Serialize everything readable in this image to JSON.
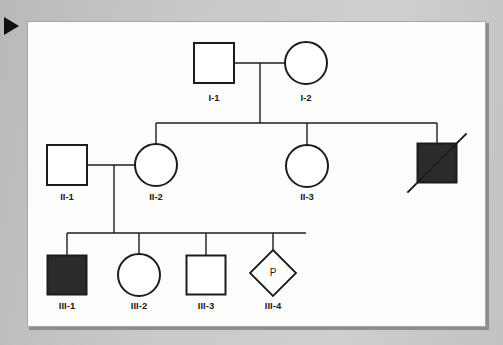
{
  "figure": {
    "marker_icon": "play-triangle-icon",
    "background_color": "#c8c8c8",
    "panel_color": "#fdfdfb",
    "line_color": "#1c1c1c",
    "affected_fill_color": "#2b2b2b",
    "unaffected_fill_color": "#ffffff"
  },
  "chart_data": {
    "type": "diagram",
    "diagram_type": "pedigree",
    "generations": [
      "I",
      "II",
      "III"
    ],
    "individuals": [
      {
        "id": "I-1",
        "label": "I-1",
        "shape": "square",
        "sex": "male",
        "affected": false,
        "deceased": false,
        "proband": false,
        "x": 213,
        "y": 62,
        "size": 40,
        "label_x": 213,
        "label_y": 97
      },
      {
        "id": "I-2",
        "label": "I-2",
        "shape": "circle",
        "sex": "female",
        "affected": false,
        "deceased": false,
        "proband": false,
        "x": 305,
        "y": 62,
        "size": 42,
        "label_x": 305,
        "label_y": 97
      },
      {
        "id": "II-1",
        "label": "II-1",
        "shape": "square",
        "sex": "male",
        "affected": false,
        "deceased": false,
        "proband": false,
        "x": 66,
        "y": 164,
        "size": 40,
        "label_x": 66,
        "label_y": 196
      },
      {
        "id": "II-2",
        "label": "II-2",
        "shape": "circle",
        "sex": "female",
        "affected": false,
        "deceased": false,
        "proband": false,
        "x": 155,
        "y": 164,
        "size": 42,
        "label_x": 155,
        "label_y": 196
      },
      {
        "id": "II-3",
        "label": "II-3",
        "shape": "circle",
        "sex": "female",
        "affected": false,
        "deceased": false,
        "proband": false,
        "x": 306,
        "y": 165,
        "size": 42,
        "label_x": 306,
        "label_y": 196
      },
      {
        "id": "II-4",
        "label": "",
        "shape": "square",
        "sex": "male",
        "affected": true,
        "deceased": true,
        "proband": false,
        "x": 436,
        "y": 162,
        "size": 39,
        "label_x": 436,
        "label_y": 196
      },
      {
        "id": "III-1",
        "label": "III-1",
        "shape": "square",
        "sex": "male",
        "affected": true,
        "deceased": false,
        "proband": false,
        "x": 66,
        "y": 274,
        "size": 39,
        "label_x": 66,
        "label_y": 305
      },
      {
        "id": "III-2",
        "label": "III-2",
        "shape": "circle",
        "sex": "female",
        "affected": false,
        "deceased": false,
        "proband": false,
        "x": 138,
        "y": 274,
        "size": 42,
        "label_x": 138,
        "label_y": 305
      },
      {
        "id": "III-3",
        "label": "III-3",
        "shape": "square",
        "sex": "male",
        "affected": false,
        "deceased": false,
        "proband": false,
        "x": 205,
        "y": 274,
        "size": 39,
        "label_x": 205,
        "label_y": 305
      },
      {
        "id": "III-4",
        "label": "III-4",
        "shape": "diamond",
        "sex": "unknown",
        "affected": false,
        "deceased": false,
        "proband": true,
        "proband_marker": "P",
        "x": 272,
        "y": 272,
        "size": 46,
        "label_x": 272,
        "label_y": 305
      }
    ],
    "matings": [
      {
        "id": "mating-I",
        "partners": [
          "I-1",
          "I-2"
        ],
        "line_y": 62,
        "line_x1": 233,
        "line_x2": 284,
        "descent_x": 259,
        "descent_y1": 62,
        "descent_y2": 122
      },
      {
        "id": "mating-II",
        "partners": [
          "II-1",
          "II-2"
        ],
        "line_y": 164,
        "line_x1": 86,
        "line_x2": 134,
        "descent_x": 113,
        "descent_y1": 164,
        "descent_y2": 232
      }
    ],
    "sibships": [
      {
        "id": "sibship-II",
        "bar_y": 122,
        "bar_x1": 155,
        "bar_x2": 436,
        "children": [
          "II-2",
          "II-3",
          "II-4"
        ],
        "child_drop_xs": [
          155,
          306,
          436
        ],
        "drop_y2": [
          143,
          144,
          143
        ]
      },
      {
        "id": "sibship-III",
        "bar_y": 232,
        "bar_x1": 66,
        "bar_x2": 305,
        "children": [
          "III-1",
          "III-2",
          "III-3",
          "III-4"
        ],
        "child_drop_xs": [
          66,
          138,
          205,
          272
        ],
        "drop_y2": [
          255,
          253,
          255,
          249
        ]
      }
    ],
    "legend_notes": {
      "filled_shape": "affected individual",
      "slashed_shape": "deceased individual",
      "diamond_with_p": "proband, sex unspecified"
    }
  }
}
